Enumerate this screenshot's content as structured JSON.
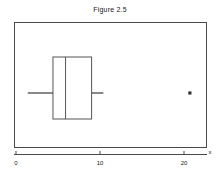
{
  "chart_data": {
    "type": "box",
    "title": "Figure 2.5",
    "xlabel": "x",
    "ylabel": "",
    "grid": false,
    "legend": null,
    "xlim": [
      -2,
      22.8
    ],
    "xticks": [
      0,
      10,
      20
    ],
    "xticklabels": [
      "0",
      "10",
      "20"
    ],
    "orientation": "horizontal",
    "series": [
      {
        "name": "x",
        "whisker_low": 1.4,
        "q1": 4.4,
        "median": 5.9,
        "q3": 9.0,
        "whisker_high": 10.4,
        "outliers": [
          20.7
        ]
      }
    ]
  },
  "figure": {
    "title": "Figure 2.5",
    "axis_label_x": "x",
    "tick_labels": [
      "0",
      "10",
      "20"
    ],
    "colors": {
      "frame": "#4a4a4a",
      "box": "#555555",
      "whisker": "#555555",
      "median": "#555555",
      "outlier": "#333333",
      "background": "#ffffff",
      "text": "#1a1a1a"
    }
  }
}
